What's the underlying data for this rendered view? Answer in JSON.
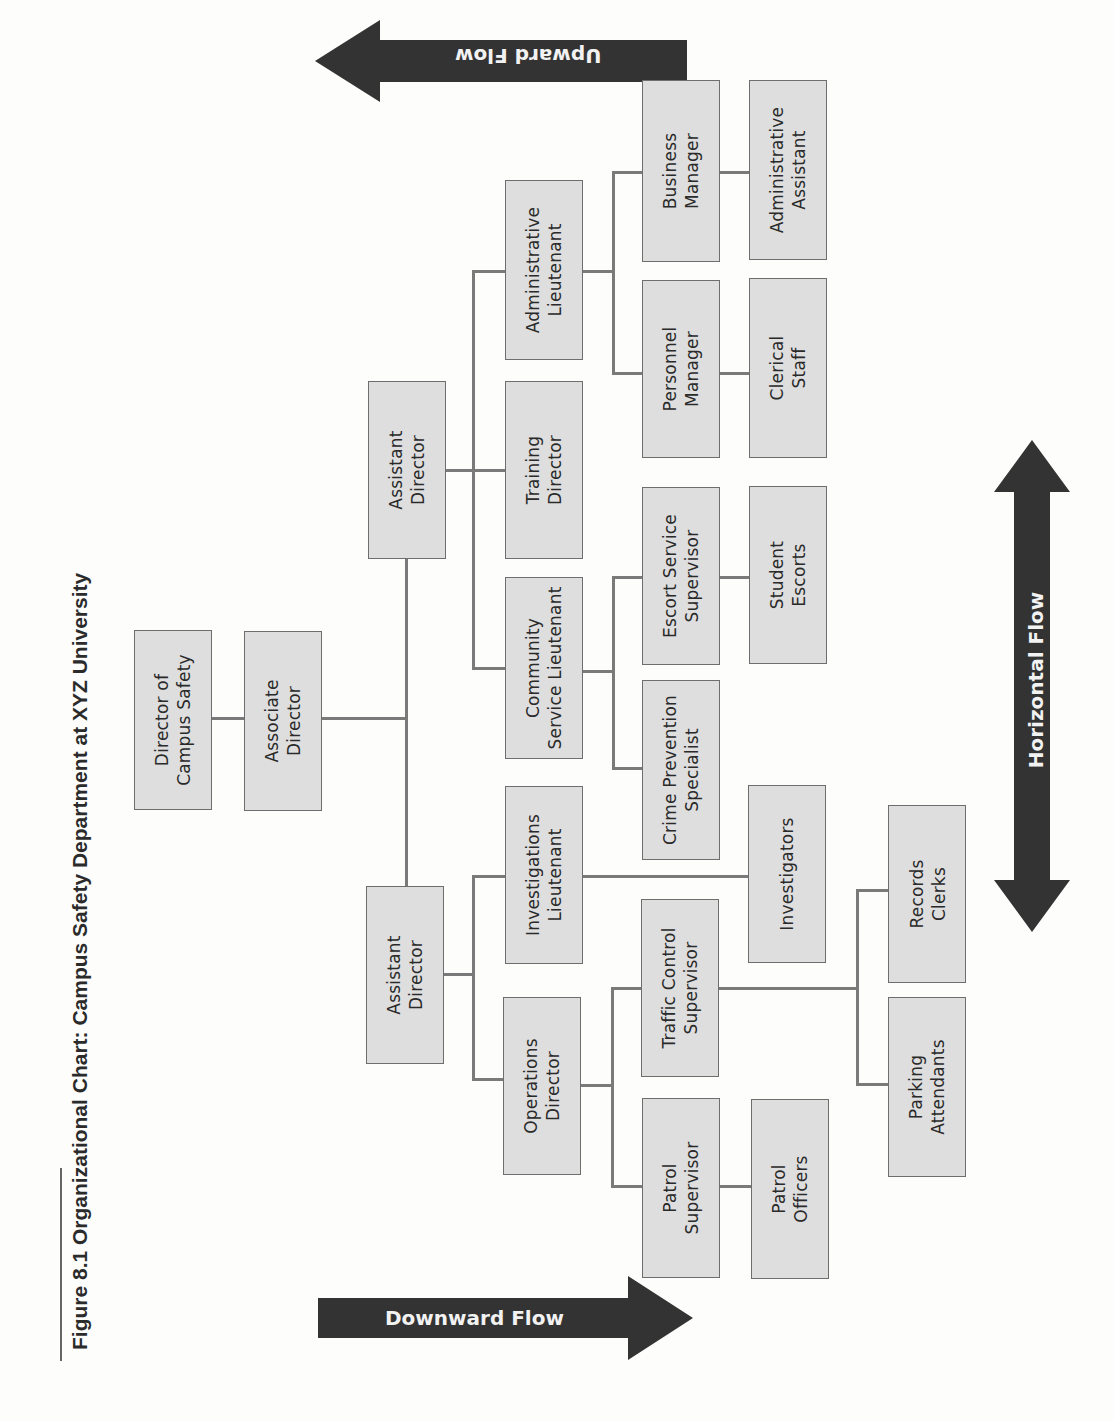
{
  "figure": {
    "title": "Figure 8.1 Organizational Chart: Campus Safety Department at XYZ University"
  },
  "flows": {
    "upward": "Upward Flow",
    "downward": "Downward Flow",
    "horizontal": "Horizontal Flow"
  },
  "colors": {
    "box_fill": "#dedede",
    "box_border": "#6e6e6e",
    "connector": "#7a7a7a",
    "arrow_fill": "#333333",
    "arrow_text": "#f2f2f2"
  },
  "nodes": {
    "director": "Director of\nCampus Safety",
    "associate_director": "Associate\nDirector",
    "assistant_director_top": "Assistant\nDirector",
    "assistant_director_bottom": "Assistant\nDirector",
    "administrative_lieutenant": "Administrative\nLieutenant",
    "training_director": "Training\nDirector",
    "community_service_lieutenant": "Community\nService Lieutenant",
    "business_manager": "Business\nManager",
    "administrative_assistant": "Administrative\nAssistant",
    "personnel_manager": "Personnel\nManager",
    "clerical_staff": "Clerical\nStaff",
    "escort_service_supervisor": "Escort Service\nSupervisor",
    "student_escorts": "Student\nEscorts",
    "crime_prevention_specialist": "Crime Prevention\nSpecialist",
    "investigations_lieutenant": "Investigations\nLieutenant",
    "investigators": "Investigators",
    "operations_director": "Operations\nDirector",
    "traffic_control_supervisor": "Traffic Control\nSupervisor",
    "patrol_supervisor": "Patrol\nSupervisor",
    "patrol_officers": "Patrol\nOfficers",
    "records_clerks": "Records\nClerks",
    "parking_attendants": "Parking\nAttendants"
  },
  "hierarchy": {
    "Director of Campus Safety": [
      "Associate Director"
    ],
    "Associate Director": [
      "Assistant Director (A)",
      "Assistant Director (B)"
    ],
    "Assistant Director (A)": [
      "Administrative Lieutenant",
      "Training Director",
      "Community Service Lieutenant"
    ],
    "Administrative Lieutenant": [
      "Business Manager",
      "Personnel Manager"
    ],
    "Business Manager": [
      "Administrative Assistant"
    ],
    "Personnel Manager": [
      "Clerical Staff"
    ],
    "Community Service Lieutenant": [
      "Escort Service Supervisor",
      "Crime Prevention Specialist"
    ],
    "Escort Service Supervisor": [
      "Student Escorts"
    ],
    "Assistant Director (B)": [
      "Investigations Lieutenant",
      "Operations Director"
    ],
    "Investigations Lieutenant": [
      "Investigators"
    ],
    "Operations Director": [
      "Traffic Control Supervisor",
      "Patrol Supervisor"
    ],
    "Traffic Control Supervisor": [
      "Records Clerks",
      "Parking Attendants"
    ],
    "Patrol Supervisor": [
      "Patrol Officers"
    ]
  }
}
